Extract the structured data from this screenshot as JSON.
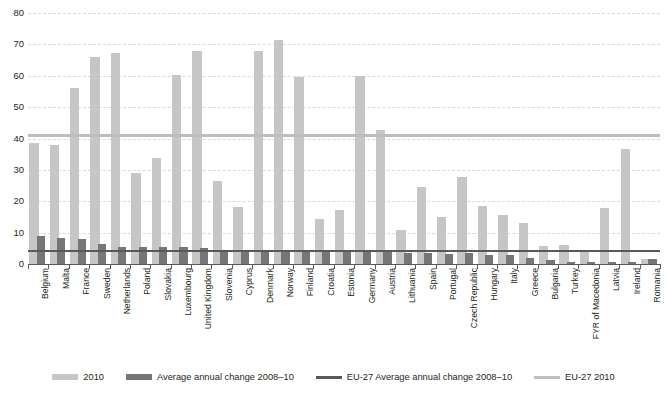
{
  "chart_data": {
    "type": "bar",
    "title": "",
    "subtitle": "",
    "xlabel": "",
    "ylabel": "",
    "ylim": [
      0,
      80
    ],
    "yticks": [
      0,
      10,
      20,
      30,
      40,
      50,
      60,
      70,
      80
    ],
    "grid": true,
    "legend_position": "bottom",
    "categories": [
      "Belgium",
      "Malta",
      "France",
      "Sweden",
      "Netherlands",
      "Poland",
      "Slovakia",
      "Luxembourg",
      "United Kingdom",
      "Slovenia",
      "Cyprus",
      "Denmark",
      "Norway",
      "Finland",
      "Croatia",
      "Estonia",
      "Germany",
      "Austria",
      "Lithuania",
      "Spain",
      "Portugal",
      "Czech Republic",
      "Hungary",
      "Italy",
      "Greece",
      "Bulgaria",
      "Turkey",
      "FYR of Macedonia",
      "Latvia",
      "Ireland",
      "Romania"
    ],
    "series": [
      {
        "name": "2010",
        "color": "#c6c6c6",
        "values": [
          38.5,
          38.0,
          56.0,
          66.0,
          67.2,
          29.0,
          33.7,
          60.2,
          67.8,
          26.6,
          18.2,
          67.8,
          71.5,
          59.5,
          14.3,
          17.2,
          60.0,
          42.8,
          11.0,
          24.7,
          15.0,
          27.8,
          18.5,
          15.5,
          13.0,
          5.7,
          6.1,
          3.8,
          17.8,
          36.8,
          1.5
        ]
      },
      {
        "name": "Average annual change 2008–10",
        "color": "#767676",
        "values": [
          9.0,
          8.2,
          8.0,
          6.3,
          5.5,
          5.4,
          5.4,
          5.3,
          5.2,
          4.3,
          4.0,
          4.2,
          4.6,
          4.3,
          4.2,
          4.4,
          4.5,
          4.3,
          3.4,
          3.5,
          3.2,
          3.4,
          3.0,
          2.9,
          2.0,
          1.3,
          0.8,
          0.7,
          0.6,
          0.5,
          1.5
        ]
      }
    ],
    "reference_lines": [
      {
        "name": "EU-27 Average annual change 2008–10",
        "value": 4.2,
        "color": "#58595b"
      },
      {
        "name": "EU-27 2010",
        "value": 41.0,
        "color": "#bdbdbd"
      }
    ]
  },
  "legend": {
    "items": [
      {
        "label": "2010",
        "type": "bar",
        "color": "#c6c6c6"
      },
      {
        "label": "Average annual change 2008–10",
        "type": "bar",
        "color": "#767676"
      },
      {
        "label": "EU-27 Average annual change 2008–10",
        "type": "line",
        "color": "#58595b"
      },
      {
        "label": "EU-27 2010",
        "type": "line",
        "color": "#bdbdbd"
      }
    ]
  }
}
